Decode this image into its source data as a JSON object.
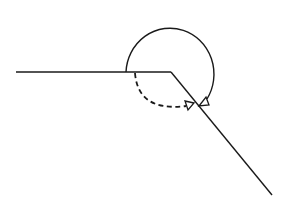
{
  "diagram": {
    "title": "",
    "colors": {
      "stroke": "#1a1a1a",
      "background": "#ffffff",
      "arrow_fill": "#ffffff"
    },
    "rays": [
      {
        "name": "horizontal-ray",
        "from": [
          16,
          72
        ],
        "to": [
          171,
          72
        ]
      },
      {
        "name": "diagonal-ray",
        "from": [
          171,
          72
        ],
        "to": [
          272,
          195
        ]
      }
    ],
    "arcs": [
      {
        "name": "reflex-angle-arc",
        "style": "solid"
      },
      {
        "name": "interior-angle-arc",
        "style": "dashed"
      }
    ],
    "labels": []
  }
}
